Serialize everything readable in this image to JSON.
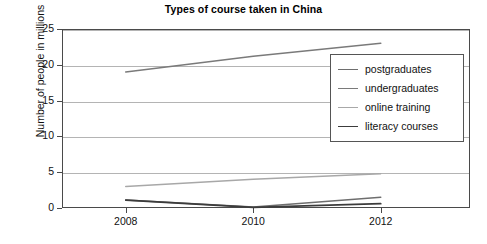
{
  "chart_data": {
    "type": "line",
    "title": "Types of course taken in China",
    "xlabel": "",
    "ylabel": "Number of people in millions",
    "x": [
      2008,
      2010,
      2012
    ],
    "categories": [
      "2008",
      "2010",
      "2012"
    ],
    "xticklabels": [
      "2008",
      "2010",
      "2012"
    ],
    "yticklabels": [
      "0",
      "5",
      "10",
      "15",
      "20",
      "25"
    ],
    "yticks": [
      0,
      5,
      10,
      15,
      20,
      25
    ],
    "ylim": [
      0,
      25
    ],
    "xlim": [
      2007,
      2013.4
    ],
    "grid": "horizontal",
    "legend_position": "upper-right-inside",
    "series": [
      {
        "name": "postgraduates",
        "values": [
          1.1,
          0.15,
          1.5
        ],
        "color": "#6e6e6e",
        "width": 1.5
      },
      {
        "name": "undergraduates",
        "values": [
          19.0,
          21.2,
          23.0
        ],
        "color": "#7a7a7a",
        "width": 1.6
      },
      {
        "name": "online training",
        "values": [
          3.0,
          4.0,
          4.8
        ],
        "color": "#a8a8a8",
        "width": 1.5
      },
      {
        "name": "literacy courses",
        "values": [
          1.1,
          0.1,
          0.6
        ],
        "color": "#3c3c3c",
        "width": 1.7
      }
    ]
  },
  "legend": {
    "items": [
      {
        "label": "postgraduates"
      },
      {
        "label": "undergraduates"
      },
      {
        "label": "online training"
      },
      {
        "label": "literacy courses"
      }
    ]
  },
  "colors": {
    "axis": "#4a4a4a",
    "gridline": "#b4b4b4",
    "text": "#111111",
    "background": "#ffffff",
    "legend_border": "#555555"
  }
}
